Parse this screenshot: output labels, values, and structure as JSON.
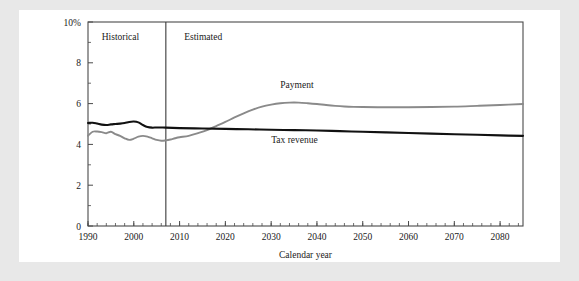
{
  "figure": {
    "background_color": "#e8e8e8",
    "panel_color": "#ffffff"
  },
  "chart_data": {
    "type": "line",
    "title": "",
    "xlabel": "Calendar year",
    "ylabel": "",
    "xlim": [
      1990,
      2085
    ],
    "ylim": [
      0,
      10
    ],
    "grid": false,
    "legend": "inline-annotations",
    "y_tick_labels": [
      "0",
      "2",
      "4",
      "6",
      "8",
      "10%"
    ],
    "y_ticks": [
      0,
      2,
      4,
      6,
      8,
      10
    ],
    "y_minor_ticks": [
      1,
      3,
      5,
      7,
      9
    ],
    "x_tick_labels": [
      "1990",
      "2000",
      "2010",
      "2020",
      "2030",
      "2040",
      "2050",
      "2060",
      "2070",
      "2080"
    ],
    "x_ticks": [
      1990,
      2000,
      2010,
      2020,
      2030,
      2040,
      2050,
      2060,
      2070,
      2080
    ],
    "x_minor_tick_step": 2,
    "annotations": [
      {
        "name": "historical-label",
        "text": "Historical",
        "x": 1993,
        "y": 9.1
      },
      {
        "name": "estimated-label",
        "text": "Estimated",
        "x": 2011,
        "y": 9.1
      },
      {
        "name": "payment-label",
        "text": "Payment",
        "x": 2032,
        "y": 6.75
      },
      {
        "name": "tax-revenue-label",
        "text": "Tax revenue",
        "x": 2030,
        "y": 4.05
      }
    ],
    "divider": {
      "name": "historical-estimated-divider",
      "x": 2007,
      "label": "projection start"
    },
    "series": [
      {
        "name": "Payment",
        "color": "#8a8a8a",
        "x": [
          1990,
          1991,
          1992,
          1993,
          1994,
          1995,
          1996,
          1997,
          1998,
          1999,
          2000,
          2001,
          2002,
          2003,
          2004,
          2005,
          2006,
          2007,
          2008,
          2009,
          2010,
          2012,
          2014,
          2016,
          2018,
          2020,
          2022,
          2024,
          2026,
          2028,
          2030,
          2032,
          2034,
          2036,
          2038,
          2040,
          2042,
          2044,
          2046,
          2048,
          2050,
          2055,
          2060,
          2065,
          2070,
          2075,
          2080,
          2085
        ],
        "values": [
          4.42,
          4.62,
          4.63,
          4.6,
          4.55,
          4.62,
          4.5,
          4.42,
          4.3,
          4.22,
          4.28,
          4.38,
          4.42,
          4.38,
          4.3,
          4.22,
          4.18,
          4.2,
          4.24,
          4.3,
          4.35,
          4.42,
          4.55,
          4.7,
          4.9,
          5.1,
          5.32,
          5.52,
          5.7,
          5.85,
          5.95,
          6.02,
          6.05,
          6.05,
          6.02,
          5.98,
          5.93,
          5.89,
          5.86,
          5.84,
          5.83,
          5.82,
          5.82,
          5.83,
          5.85,
          5.89,
          5.93,
          5.98
        ]
      },
      {
        "name": "Tax revenue",
        "color": "#111111",
        "x": [
          1990,
          1991,
          1992,
          1993,
          1994,
          1995,
          1996,
          1997,
          1998,
          1999,
          2000,
          2001,
          2002,
          2003,
          2004,
          2005,
          2006,
          2007,
          2010,
          2015,
          2020,
          2025,
          2030,
          2035,
          2040,
          2045,
          2050,
          2055,
          2060,
          2065,
          2070,
          2075,
          2080,
          2085
        ],
        "values": [
          5.05,
          5.06,
          5.02,
          4.97,
          4.95,
          4.98,
          5.0,
          5.02,
          5.05,
          5.1,
          5.12,
          5.08,
          4.95,
          4.85,
          4.82,
          4.83,
          4.83,
          4.82,
          4.8,
          4.78,
          4.76,
          4.74,
          4.72,
          4.7,
          4.68,
          4.65,
          4.62,
          4.59,
          4.56,
          4.53,
          4.5,
          4.47,
          4.44,
          4.42
        ]
      }
    ]
  }
}
